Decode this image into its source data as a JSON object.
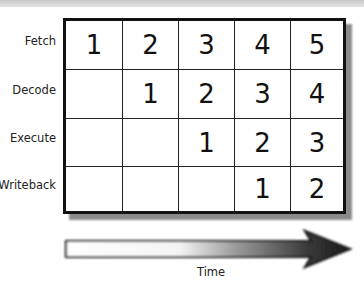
{
  "diagram": {
    "type": "pipeline-timing-diagram",
    "stages": [
      "Fetch",
      "Decode",
      "Execute",
      "Writeback"
    ],
    "columns": 5,
    "cells": [
      [
        "1",
        "2",
        "3",
        "4",
        "5"
      ],
      [
        "",
        "1",
        "2",
        "3",
        "4"
      ],
      [
        "",
        "",
        "1",
        "2",
        "3"
      ],
      [
        "",
        "",
        "",
        "1",
        "2"
      ]
    ],
    "axis_label": "Time",
    "arrow_direction": "right",
    "colors": {
      "grid_border": "#111111",
      "arrow_start": "#ffffff",
      "arrow_end": "#1a1a1a",
      "shadow": "#8a8a8a"
    }
  }
}
